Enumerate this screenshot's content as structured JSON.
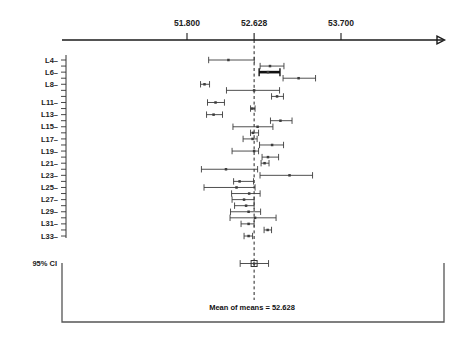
{
  "chart_data": {
    "type": "scatter",
    "subtype": "confidence-interval-plot",
    "title": "",
    "xlabel": "",
    "ylabel": "",
    "grid": false,
    "legend": null,
    "axis_ticks": [
      {
        "value": "51.800",
        "num": 51.8
      },
      {
        "value": "52.628",
        "num": 52.628
      },
      {
        "value": "53.700",
        "num": 53.7
      }
    ],
    "xlim": [
      51.28,
      54.2
    ],
    "reference_line": {
      "label": "Mean of means = 52.628",
      "value": 52.628
    },
    "summary": {
      "label": "95% CI",
      "mean": 52.628,
      "lower": 52.456,
      "upper": 52.806,
      "marker": "square"
    },
    "y_tick_labels": [
      "L4",
      "L6",
      "L8",
      "L11",
      "L13",
      "L15",
      "L17",
      "L19",
      "L21",
      "L23",
      "L25",
      "L27",
      "L29",
      "L31",
      "L33"
    ],
    "categories": [
      "L4",
      "L5",
      "L6",
      "L7",
      "L8",
      "L9",
      "L10",
      "L11",
      "L12",
      "L13",
      "L14",
      "L15",
      "L16",
      "L17",
      "L18",
      "L19",
      "L20",
      "L21",
      "L22",
      "L23",
      "L24",
      "L25",
      "L26",
      "L27",
      "L28",
      "L29",
      "L30",
      "L31",
      "L32",
      "L33"
    ],
    "series": [
      {
        "name": "Laboratory means with 95% confidence intervals",
        "points": [
          {
            "category": "L4",
            "mean": 52.311,
            "lower": 52.067,
            "upper": 52.63,
            "highlight": false
          },
          {
            "category": "L5",
            "mean": 52.824,
            "lower": 52.702,
            "upper": 52.996,
            "highlight": false
          },
          {
            "category": "L6",
            "mean": 52.799,
            "lower": 52.69,
            "upper": 52.947,
            "highlight": true
          },
          {
            "category": "L7",
            "mean": 53.177,
            "lower": 52.985,
            "upper": 53.386,
            "highlight": false
          },
          {
            "category": "L8",
            "mean": 52.016,
            "lower": 51.967,
            "upper": 52.078,
            "highlight": false
          },
          {
            "category": "L9",
            "mean": 52.628,
            "lower": 52.287,
            "upper": 52.942,
            "highlight": false
          },
          {
            "category": "L10",
            "mean": 52.911,
            "lower": 52.843,
            "upper": 52.99,
            "highlight": false
          },
          {
            "category": "L11",
            "mean": 52.152,
            "lower": 52.053,
            "upper": 52.262,
            "highlight": false
          },
          {
            "category": "L12",
            "mean": 52.603,
            "lower": 52.584,
            "upper": 52.64,
            "highlight": false
          },
          {
            "category": "L13",
            "mean": 52.128,
            "lower": 52.041,
            "upper": 52.238,
            "highlight": false
          },
          {
            "category": "L14",
            "mean": 52.953,
            "lower": 52.83,
            "upper": 53.096,
            "highlight": false
          },
          {
            "category": "L15",
            "mean": 52.671,
            "lower": 52.367,
            "upper": 52.86,
            "highlight": false
          },
          {
            "category": "L16",
            "mean": 52.615,
            "lower": 52.584,
            "upper": 52.683,
            "highlight": false
          },
          {
            "category": "L17",
            "mean": 52.609,
            "lower": 52.492,
            "upper": 52.665,
            "highlight": false
          },
          {
            "category": "L18",
            "mean": 52.85,
            "lower": 52.695,
            "upper": 52.991,
            "highlight": false
          },
          {
            "category": "L19",
            "mean": 52.628,
            "lower": 52.356,
            "upper": 52.683,
            "highlight": false
          },
          {
            "category": "L20",
            "mean": 52.799,
            "lower": 52.726,
            "upper": 52.93,
            "highlight": false
          },
          {
            "category": "L21",
            "mean": 52.757,
            "lower": 52.714,
            "upper": 52.812,
            "highlight": false
          },
          {
            "category": "L22",
            "mean": 52.281,
            "lower": 51.978,
            "upper": 52.671,
            "highlight": false
          },
          {
            "category": "L23",
            "mean": 53.065,
            "lower": 52.701,
            "upper": 53.349,
            "highlight": false
          },
          {
            "category": "L24",
            "mean": 52.449,
            "lower": 52.375,
            "upper": 52.621,
            "highlight": false
          },
          {
            "category": "L25",
            "mean": 52.411,
            "lower": 52.01,
            "upper": 52.64,
            "highlight": false
          },
          {
            "category": "L26",
            "mean": 52.567,
            "lower": 52.35,
            "upper": 52.702,
            "highlight": false
          },
          {
            "category": "L27",
            "mean": 52.504,
            "lower": 52.356,
            "upper": 52.628,
            "highlight": false
          },
          {
            "category": "L28",
            "mean": 52.529,
            "lower": 52.387,
            "upper": 52.628,
            "highlight": false
          },
          {
            "category": "L29",
            "mean": 52.56,
            "lower": 52.337,
            "upper": 52.708,
            "highlight": false
          },
          {
            "category": "L30",
            "mean": 52.64,
            "lower": 52.331,
            "upper": 52.899,
            "highlight": false
          },
          {
            "category": "L31",
            "mean": 52.56,
            "lower": 52.467,
            "upper": 52.628,
            "highlight": false
          },
          {
            "category": "L32",
            "mean": 52.795,
            "lower": 52.751,
            "upper": 52.843,
            "highlight": false
          },
          {
            "category": "L33",
            "mean": 52.56,
            "lower": 52.504,
            "upper": 52.609,
            "highlight": false
          }
        ]
      }
    ],
    "colors": {
      "axis": "#1a1a1a",
      "interval": "#3c3c3c",
      "highlight": "#111111",
      "reference": "#222222",
      "box": "#555555"
    }
  }
}
